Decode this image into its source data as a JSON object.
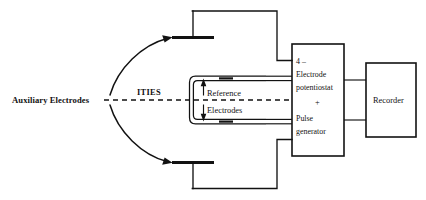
{
  "figure": {
    "background_color": "#ffffff",
    "ink_color": "#121212"
  },
  "labels": {
    "auxiliary_electrodes": "Auxiliary Electrodes",
    "ities": "ITIES",
    "reference": "Reference",
    "electrodes": "Electrodes"
  },
  "potentiostat_box": {
    "name": "4-electrode-potentiostat-pulse-generator",
    "lines": [
      "4 –",
      "Electrode",
      "potentiostat",
      "+",
      "Pulse",
      "generator"
    ],
    "line_1": "4 –",
    "line_2": "Electrode",
    "line_3": "potentiostat",
    "line_4": "+",
    "line_5": "Pulse",
    "line_6": "generator"
  },
  "recorder_box": {
    "name": "recorder",
    "label": "Recorder"
  },
  "components": {
    "auxiliary_electrode_top": "auxiliary-electrode-top",
    "auxiliary_electrode_bottom": "auxiliary-electrode-bottom",
    "reference_electrode_top": "reference-electrode-top",
    "reference_electrode_bottom": "reference-electrode-bottom",
    "interface_line": "ities-interface-dashed-line",
    "pointer_up": "reference-pointer-up-arrow",
    "pointer_down": "electrodes-pointer-down-arrow",
    "curve_top": "auxiliary-pointer-curve-top",
    "curve_bottom": "auxiliary-pointer-curve-bottom"
  }
}
